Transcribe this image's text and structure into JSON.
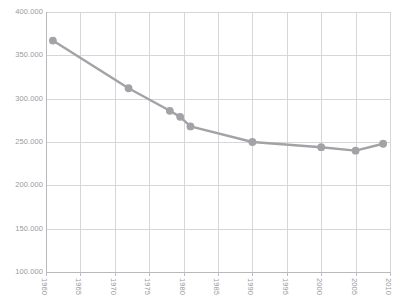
{
  "chart_data": {
    "type": "line",
    "title": "",
    "xlabel": "",
    "ylabel": "",
    "xlim": [
      1960,
      2010
    ],
    "ylim": [
      100000,
      400000
    ],
    "grid": true,
    "legend": false,
    "legend_position": "none",
    "series_color": "#a3a3a7",
    "marker": "circle",
    "x_tick_labels": [
      "1960",
      "1965",
      "1970",
      "1975",
      "1980",
      "1985",
      "1990",
      "1995",
      "2000",
      "2005",
      "2010"
    ],
    "x_ticks": [
      1960,
      1965,
      1970,
      1975,
      1980,
      1985,
      1990,
      1995,
      2000,
      2005,
      2010
    ],
    "y_tick_labels": [
      "400.000",
      "350.000",
      "300.000",
      "250.000",
      "200.000",
      "150.000",
      "100.000"
    ],
    "y_ticks": [
      400000,
      350000,
      300000,
      250000,
      200000,
      150000,
      100000
    ],
    "series": [
      {
        "name": "series-1",
        "x": [
          1961,
          1972,
          1978,
          1979.5,
          1981,
          1990,
          2000,
          2005,
          2009
        ],
        "values": [
          367000,
          312000,
          286000,
          279000,
          268000,
          250000,
          244000,
          240000,
          248000
        ]
      }
    ]
  }
}
